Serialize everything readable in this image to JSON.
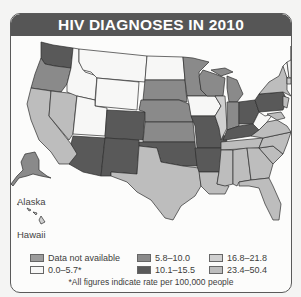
{
  "title": "HIV DIAGNOSES IN 2010",
  "colors": {
    "na": "#9c9c9c",
    "r0": "#f7f7f6",
    "r1": "#8a8a8a",
    "r2": "#595959",
    "r3": "#cfcfcf",
    "r4": "#bdbdbd"
  },
  "insets": {
    "alaska": "Alaska",
    "hawaii": "Hawaii"
  },
  "legend": {
    "items": [
      {
        "label": "Data not available",
        "key": "na"
      },
      {
        "label": "0.0–5.7*",
        "key": "r0"
      },
      {
        "label": "5.8–10.0",
        "key": "r1"
      },
      {
        "label": "10.1–15.5",
        "key": "r2"
      },
      {
        "label": "16.8–21.8",
        "key": "r3"
      },
      {
        "label": "23.4–50.4",
        "key": "r4"
      }
    ]
  },
  "footnote": "*All figures indicate rate per 100,000 people",
  "states": {
    "WA": "r2",
    "OR": "r1",
    "CA": "r4",
    "NV": "r4",
    "ID": "r0",
    "MT": "r0",
    "WY": "r0",
    "UT": "r0",
    "AZ": "r2",
    "CO": "r2",
    "NM": "r2",
    "ND": "r0",
    "SD": "r1",
    "NE": "r1",
    "KS": "r1",
    "OK": "r2",
    "TX": "r4",
    "MN": "r1",
    "IA": "r0",
    "MO": "r2",
    "AR": "r2",
    "LA": "r4",
    "WI": "r1",
    "IL": "r3",
    "MI": "r1",
    "IN": "r1",
    "OH": "r2",
    "KY": "r2",
    "TN": "r4",
    "MS": "r4",
    "AL": "r4",
    "GA": "r4",
    "FL": "r4",
    "SC": "r4",
    "NC": "r4",
    "VA": "r4",
    "WV": "r0",
    "PA": "r2",
    "NY": "r4",
    "VT": "r0",
    "NH": "r0",
    "ME": "r1",
    "MA": "r3",
    "NJ": "r4",
    "MD": "r4",
    "AK": "r1",
    "HI": "r3"
  }
}
